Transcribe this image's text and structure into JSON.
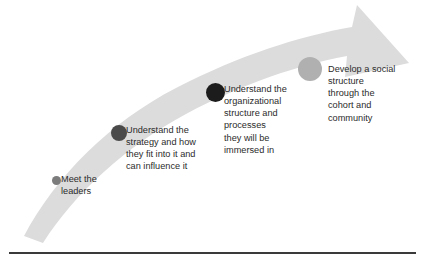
{
  "diagram": {
    "arrow": {
      "name": "upward-curving-arrow",
      "direction": "lower-left to upper-right",
      "fill_color": "#dcdcdc"
    },
    "bottom_rule_color": "#3a3a3a",
    "stages": [
      {
        "id": "meet-the-leaders",
        "label": "Meet the\nleaders",
        "dot_color": "#7c7c7c",
        "dot_size": 9
      },
      {
        "id": "understand-the-strategy",
        "label": "Understand the\nstrategy and how\nthey fit into it and\ncan influence it",
        "dot_color": "#4a4a4a",
        "dot_size": 16
      },
      {
        "id": "understand-the-organizational-structure",
        "label": "Understand the\norganizational\nstructure and\nprocesses\nthey will be\nimmersed in",
        "dot_color": "#1c1c1c",
        "dot_size": 19
      },
      {
        "id": "develop-a-social-structure",
        "label": "Develop a social\nstructure\nthrough the\ncohort and\ncommunity",
        "dot_color": "#b0b0b0",
        "dot_size": 24
      }
    ]
  }
}
